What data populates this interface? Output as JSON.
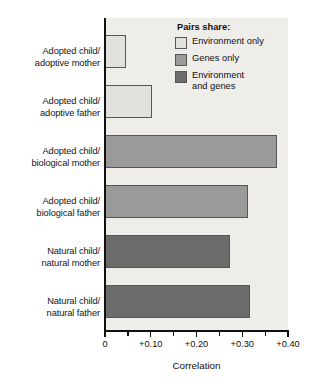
{
  "chart_data": {
    "type": "bar",
    "orientation": "horizontal",
    "title": "",
    "xlabel": "Correlation",
    "ylabel": "",
    "xlim": [
      0,
      0.4
    ],
    "grid": false,
    "categories": [
      "Adopted child/ adoptive mother",
      "Adopted child/ adoptive father",
      "Adopted child/ biological mother",
      "Adopted child/ biological father",
      "Natural child/ natural mother",
      "Natural child/ natural father"
    ],
    "category_lines": [
      [
        "Adopted child/",
        "adoptive mother"
      ],
      [
        "Adopted child/",
        "adoptive father"
      ],
      [
        "Adopted child/",
        "biological mother"
      ],
      [
        "Adopted child/",
        "biological father"
      ],
      [
        "Natural child/",
        "natural mother"
      ],
      [
        "Natural child/",
        "natural father"
      ]
    ],
    "values": [
      0.046,
      0.103,
      0.376,
      0.313,
      0.274,
      0.317
    ],
    "group_of_bar": [
      "Environment only",
      "Environment only",
      "Genes only",
      "Genes only",
      "Environment and genes",
      "Environment and genes"
    ],
    "xticks": [
      0,
      0.05,
      0.1,
      0.15,
      0.2,
      0.25,
      0.3,
      0.35,
      0.4
    ],
    "xtick_labels": [
      "0",
      "",
      "+0.10",
      "",
      "+0.20",
      "",
      "+0.30",
      "",
      "+0.40"
    ],
    "legend_position": "top-right",
    "colors": {
      "environment_only": "#e2e1dd",
      "genes_only": "#9a9a9a",
      "environment_and_genes": "#6b6b6b",
      "bar_outline": "#55565a",
      "plot_background": "#eeedea",
      "axis": "#111111",
      "text": "#111111"
    }
  },
  "legend": {
    "title": "Pairs share:",
    "items": [
      {
        "label": "Environment only",
        "line1": "Environment only",
        "line2": "",
        "color": "#e2e1dd"
      },
      {
        "label": "Genes only",
        "line1": "Genes only",
        "line2": "",
        "color": "#9a9a9a"
      },
      {
        "label": "Environment and genes",
        "line1": "Environment",
        "line2": "and genes",
        "color": "#6b6b6b"
      }
    ]
  },
  "axis": {
    "title": "Correlation",
    "tick_labels": {
      "t0": "0",
      "t1": "+0.10",
      "t2": "+0.20",
      "t3": "+0.30",
      "t4": "+0.40"
    }
  }
}
